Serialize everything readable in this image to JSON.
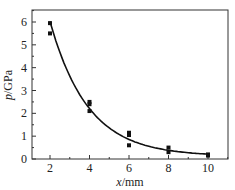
{
  "chart_data": {
    "type": "scatter",
    "title": "",
    "xlabel": "x/mm",
    "ylabel": "p/GPa",
    "xlim": [
      1,
      11
    ],
    "ylim": [
      0,
      6.5
    ],
    "xticks": [
      "2",
      "4",
      "6",
      "8",
      "10"
    ],
    "yticks": [
      "0",
      "1",
      "2",
      "3",
      "4",
      "5",
      "6"
    ],
    "grid": false,
    "legend": null,
    "series": [
      {
        "name": "measured",
        "kind": "scatter",
        "marker": "square",
        "x": [
          2,
          2,
          4,
          4,
          4,
          6,
          6,
          6,
          8,
          8,
          10,
          10
        ],
        "y": [
          5.95,
          5.5,
          2.5,
          2.4,
          2.1,
          1.15,
          1.05,
          0.6,
          0.5,
          0.3,
          0.2,
          0.15
        ]
      },
      {
        "name": "fit",
        "kind": "line",
        "x": [
          2,
          3,
          4,
          5,
          6,
          7,
          8,
          9,
          10
        ],
        "y": [
          5.9,
          3.75,
          2.35,
          1.45,
          0.9,
          0.55,
          0.35,
          0.25,
          0.2
        ]
      }
    ]
  },
  "axes": {
    "xlabel_italic": "x",
    "xlabel_unit": "/mm",
    "ylabel_italic": "p",
    "ylabel_unit": "/GPa"
  }
}
